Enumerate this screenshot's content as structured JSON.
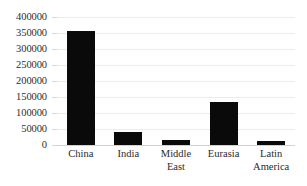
{
  "chart_data": {
    "type": "bar",
    "title": "",
    "subtitle": "",
    "xlabel": "",
    "ylabel": "",
    "categories": [
      "China",
      "India",
      "Middle East",
      "Eurasia",
      "Latin America"
    ],
    "values": [
      355000,
      42000,
      16000,
      134000,
      11500
    ],
    "series": [
      {
        "name": "",
        "values": [
          355000,
          42000,
          16000,
          134000,
          11500
        ]
      }
    ],
    "ylim": [
      0,
      400000
    ],
    "ytick_values": [
      0,
      50000,
      100000,
      150000,
      200000,
      250000,
      300000,
      350000,
      400000
    ],
    "ytick_labels": [
      "0",
      "50000",
      "100000",
      "150000",
      "200000",
      "250000",
      "300000",
      "350000",
      "400000"
    ],
    "grid": true,
    "grid_axis": "y",
    "legend": false,
    "legend_position": "none",
    "bar_color": "#0a0a0a",
    "gridline_color": "#ececec",
    "axis_color": "#d2d2d2",
    "text_color": "#2e2e2e",
    "annotations": []
  }
}
